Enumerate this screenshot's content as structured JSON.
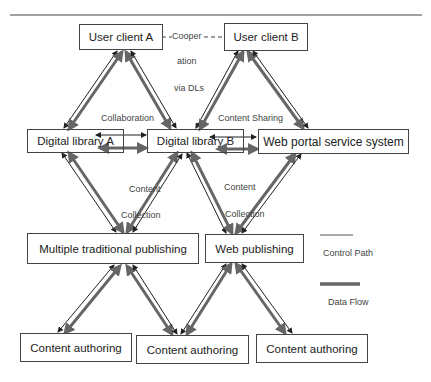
{
  "diagram": {
    "nodes": [
      {
        "id": "user_client_a",
        "label": "User client A"
      },
      {
        "id": "user_client_b",
        "label": "User client B"
      },
      {
        "id": "digital_library_a",
        "label": "Digital library A"
      },
      {
        "id": "digital_library_b",
        "label": "Digital library B"
      },
      {
        "id": "web_portal",
        "label": "Web portal service system"
      },
      {
        "id": "multiple_traditional_publishing",
        "label": "Multiple traditional publishing"
      },
      {
        "id": "web_publishing",
        "label": "Web publishing"
      },
      {
        "id": "content_authoring_1",
        "label": "Content authoring"
      },
      {
        "id": "content_authoring_2",
        "label": "Content authoring"
      },
      {
        "id": "content_authoring_3",
        "label": "Content authoring"
      }
    ],
    "edge_labels": {
      "cooperation_1": "Cooper",
      "cooperation_2": "ation",
      "cooperation_3": "via DLs",
      "collaboration": "Collaboration",
      "content_sharing": "Content Sharing",
      "content_collection_a_1": "Content",
      "content_collection_a_2": "Collection",
      "content_collection_b_1": "Content",
      "content_collection_b_2": "Collection"
    },
    "legend": {
      "control_path": "Control Path",
      "data_flow": "Data Flow"
    },
    "colors": {
      "control_path": "#222222",
      "data_flow": "#666666",
      "box_border": "#444444"
    }
  }
}
